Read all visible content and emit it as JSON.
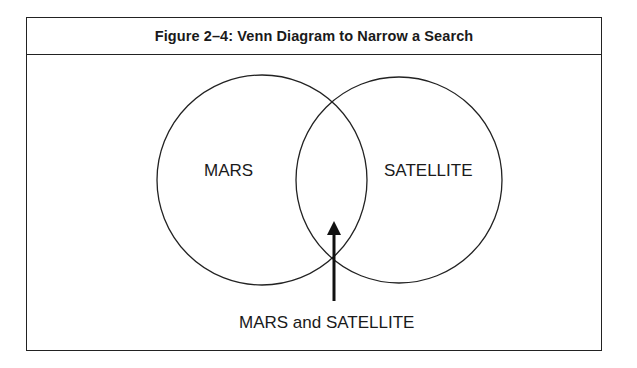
{
  "figure": {
    "title": "Figure 2–4: Venn Diagram to Narrow a Search"
  },
  "venn": {
    "sets": [
      {
        "label": "MARS",
        "cx": 262,
        "cy": 180,
        "r": 105
      },
      {
        "label": "SATELLITE",
        "cx": 399,
        "cy": 180,
        "r": 103
      }
    ],
    "intersection_label": "MARS and SATELLITE",
    "stroke_color": "#222222",
    "background_color": "#ffffff"
  }
}
